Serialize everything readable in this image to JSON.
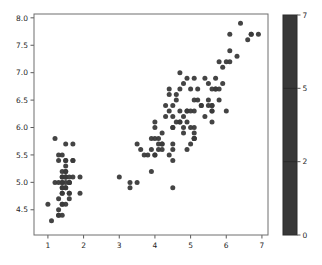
{
  "figure": {
    "background": "#ffffff"
  },
  "chart_data": {
    "type": "scatter",
    "title": "",
    "xlabel": "",
    "ylabel": "",
    "grid": false,
    "xlim": [
      0.61,
      7.17
    ],
    "ylim": [
      4.04,
      8.07
    ],
    "x_ticks": [
      1,
      2,
      3,
      4,
      5,
      6,
      7
    ],
    "x_tick_labels": [
      "1",
      "2",
      "3",
      "4",
      "5",
      "6",
      "7"
    ],
    "y_ticks": [
      4.5,
      5.0,
      5.5,
      6.0,
      6.5,
      7.0,
      7.5,
      8.0
    ],
    "y_tick_labels": [
      "4.5",
      "5.0",
      "5.5",
      "6.0",
      "6.5",
      "7.0",
      "7.5",
      "8.0"
    ],
    "point_color": "#3a3a3a",
    "point_radius": 2.5,
    "spine_color": "#6e6e6e",
    "tick_color": "#5a5a5a",
    "label_color": "#262626",
    "x": [
      1.4,
      1.4,
      1.3,
      1.5,
      1.4,
      1.7,
      1.4,
      1.5,
      1.4,
      1.5,
      1.5,
      1.6,
      1.4,
      1.1,
      1.2,
      1.5,
      1.3,
      1.4,
      1.7,
      1.5,
      1.7,
      1.5,
      1.0,
      1.7,
      1.9,
      1.6,
      1.6,
      1.5,
      1.4,
      1.6,
      1.6,
      1.5,
      1.5,
      1.4,
      1.5,
      1.2,
      1.3,
      1.4,
      1.3,
      1.5,
      1.3,
      1.3,
      1.3,
      1.6,
      1.9,
      1.4,
      1.6,
      1.4,
      1.5,
      1.4,
      4.7,
      4.5,
      4.9,
      4.0,
      4.6,
      4.5,
      4.7,
      3.3,
      4.6,
      3.9,
      3.5,
      4.2,
      4.0,
      4.7,
      3.6,
      4.4,
      4.5,
      4.1,
      4.5,
      3.9,
      4.8,
      4.0,
      4.9,
      4.7,
      4.3,
      4.4,
      4.8,
      5.0,
      4.5,
      3.5,
      3.8,
      3.7,
      3.9,
      5.1,
      4.5,
      4.5,
      4.7,
      4.4,
      4.1,
      4.0,
      4.4,
      4.6,
      4.0,
      3.3,
      4.2,
      4.2,
      4.2,
      4.3,
      3.0,
      4.1,
      6.0,
      5.1,
      5.9,
      5.6,
      5.8,
      6.6,
      4.5,
      6.3,
      5.8,
      6.1,
      5.1,
      5.3,
      5.5,
      5.0,
      5.1,
      5.3,
      5.5,
      6.7,
      6.9,
      5.0,
      5.7,
      4.9,
      6.7,
      4.9,
      5.7,
      6.0,
      4.8,
      4.9,
      5.6,
      5.8,
      6.1,
      6.4,
      5.6,
      5.1,
      5.6,
      6.1,
      5.6,
      5.5,
      4.8,
      5.4,
      5.6,
      5.1,
      5.1,
      5.9,
      5.7,
      5.2,
      5.0,
      5.2,
      5.4,
      5.1
    ],
    "y": [
      5.1,
      4.9,
      4.7,
      4.6,
      5.0,
      5.4,
      4.6,
      5.0,
      4.4,
      4.9,
      5.4,
      4.8,
      4.8,
      4.3,
      5.8,
      5.7,
      5.4,
      5.1,
      5.7,
      5.1,
      5.4,
      5.1,
      4.6,
      5.1,
      4.8,
      5.0,
      5.0,
      5.2,
      5.2,
      4.7,
      4.8,
      5.4,
      5.2,
      5.5,
      4.9,
      5.0,
      5.5,
      4.9,
      4.4,
      5.1,
      5.0,
      4.5,
      4.4,
      5.0,
      5.1,
      4.8,
      5.1,
      4.6,
      5.3,
      5.0,
      7.0,
      6.4,
      6.9,
      5.5,
      6.5,
      5.7,
      6.3,
      4.9,
      6.6,
      5.2,
      5.0,
      5.9,
      6.0,
      6.1,
      5.6,
      6.7,
      5.6,
      5.8,
      6.2,
      5.6,
      5.9,
      6.1,
      6.3,
      6.1,
      6.4,
      6.6,
      6.8,
      6.7,
      6.0,
      5.7,
      5.5,
      5.5,
      5.8,
      6.0,
      5.4,
      6.0,
      6.7,
      6.3,
      5.6,
      5.5,
      5.5,
      6.1,
      5.8,
      5.0,
      5.6,
      5.7,
      5.7,
      6.2,
      5.1,
      5.7,
      6.3,
      5.8,
      7.1,
      6.3,
      6.5,
      7.6,
      4.9,
      7.3,
      6.7,
      7.2,
      6.5,
      6.4,
      6.8,
      5.7,
      5.8,
      6.4,
      6.5,
      7.7,
      7.7,
      6.0,
      6.9,
      5.6,
      7.7,
      6.3,
      6.7,
      7.2,
      6.2,
      6.1,
      6.4,
      7.2,
      7.4,
      7.9,
      6.4,
      6.3,
      6.1,
      7.7,
      6.3,
      6.4,
      6.0,
      6.9,
      6.7,
      6.9,
      5.8,
      6.8,
      6.7,
      6.7,
      6.3,
      6.5,
      6.2,
      5.9
    ],
    "colorbar": {
      "ticks": [
        "0",
        "2",
        "5",
        "7"
      ],
      "tick_positions": [
        0,
        0.3333,
        0.6667,
        1
      ],
      "boundaries": [
        0,
        2,
        5,
        7
      ],
      "fill_color": "#383838",
      "outline_color": "#2b2b2b",
      "legend_position": "right"
    }
  }
}
